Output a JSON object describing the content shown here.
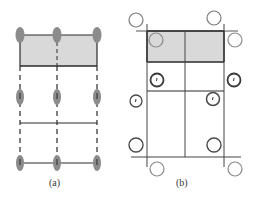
{
  "figure": {
    "panels": [
      {
        "id": "a",
        "label": "(a)",
        "description": "Three columns of gray elliptical nodes in three rows, connected by dashed vertical lines and solid horizontal lines; top cell shaded gray",
        "node_columns_x": [
          20,
          57,
          97
        ],
        "node_rows_y": [
          35,
          97,
          163
        ],
        "shaded_region": {
          "x": 20,
          "y": 35,
          "w": 77,
          "h": 31
        },
        "horizontal_lines_y": [
          35,
          66,
          123,
          163
        ]
      },
      {
        "id": "b",
        "label": "(b)",
        "description": "2x3 grid of cells with shaded top row; hollow circles of varying line weight placed around and inside the grid, some marked with a small tick",
        "grid_columns_x": [
          147,
          185,
          224
        ],
        "grid_rows_y": [
          31,
          62,
          91,
          157
        ],
        "shaded_region": {
          "x": 147,
          "y": 31,
          "w": 77,
          "h": 31
        }
      }
    ]
  },
  "colors": {
    "node_fill": "#8c8c8c",
    "shade_fill": "#d9d9d9",
    "line": "#2a2a2a",
    "circle_light": "#8a8a8a",
    "circle_dark": "#3a3a3a"
  }
}
